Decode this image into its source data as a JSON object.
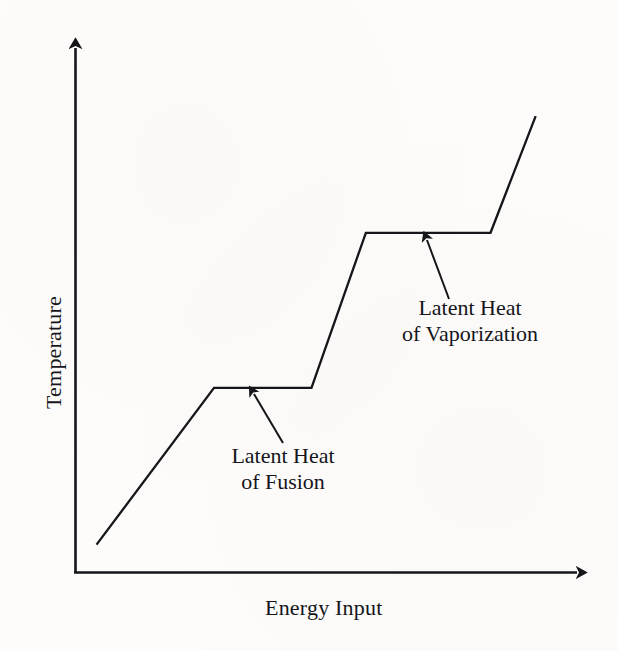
{
  "figure": {
    "background_color": "#fdfcfa",
    "ink_color": "#15151a"
  },
  "axes": {
    "y_label": "Temperature",
    "x_label": "Energy Input",
    "y_axis_name": "temperature-axis",
    "x_axis_name": "energy-input-axis"
  },
  "annotations": {
    "fusion": {
      "line1": "Latent Heat",
      "line2": "of Fusion"
    },
    "vaporization": {
      "line1": "Latent Heat",
      "line2": "of Vaporization"
    }
  },
  "chart_data": {
    "type": "line",
    "title": "",
    "subtitle": "",
    "xlabel": "Energy Input",
    "ylabel": "Temperature",
    "xlim": [
      0,
      100
    ],
    "ylim": [
      0,
      100
    ],
    "grid": false,
    "legend": null,
    "axis_ticks": {
      "x": [],
      "y": []
    },
    "axis_arrows": {
      "x": "right",
      "y": "up"
    },
    "series": [
      {
        "name": "heating curve",
        "color": "#15151a",
        "line_width": 2,
        "x": [
          4.1,
          27.0,
          46.0,
          56.6,
          80.9,
          89.7
        ],
        "y": [
          5.2,
          34.5,
          34.5,
          63.5,
          63.5,
          85.3
        ],
        "points": [
          {
            "x": 4.1,
            "y": 5.2,
            "phase": "solid",
            "label": "start of heating"
          },
          {
            "x": 27.0,
            "y": 34.5,
            "phase": "melting point",
            "label": "start of fusion plateau"
          },
          {
            "x": 46.0,
            "y": 34.5,
            "phase": "melting point",
            "label": "end of fusion plateau"
          },
          {
            "x": 56.6,
            "y": 63.5,
            "phase": "boiling point",
            "label": "start of vaporization plateau"
          },
          {
            "x": 80.9,
            "y": 63.5,
            "phase": "boiling point",
            "label": "end of vaporization plateau"
          },
          {
            "x": 89.7,
            "y": 85.3,
            "phase": "gas",
            "label": "end of heating"
          }
        ],
        "segments": [
          {
            "name": "solid-heating",
            "slope": "rising",
            "from": 0,
            "to": 1
          },
          {
            "name": "fusion-plateau",
            "slope": "flat",
            "from": 1,
            "to": 2
          },
          {
            "name": "liquid-heating",
            "slope": "rising",
            "from": 2,
            "to": 3
          },
          {
            "name": "vaporization-plateau",
            "slope": "flat",
            "from": 3,
            "to": 4
          },
          {
            "name": "gas-heating",
            "slope": "rising",
            "from": 4,
            "to": 5
          }
        ]
      }
    ],
    "annotations": [
      {
        "name": "latent-heat-of-fusion",
        "text": "Latent Heat of Fusion",
        "points_to_x": 35.0,
        "points_to_y": 34.5
      },
      {
        "name": "latent-heat-of-vaporization",
        "text": "Latent Heat of Vaporization",
        "points_to_x": 68.0,
        "points_to_y": 63.5
      }
    ]
  }
}
